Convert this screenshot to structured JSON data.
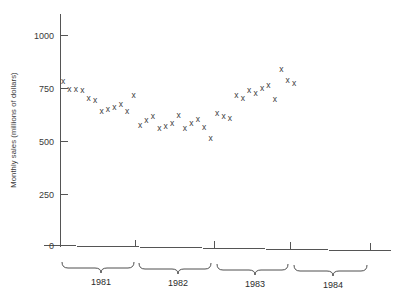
{
  "chart_data": {
    "type": "scatter",
    "title": "",
    "xlabel": "",
    "ylabel": "Monthly sales (millions of dollars)",
    "ylim": [
      0,
      1100
    ],
    "yticks": [
      0,
      250,
      500,
      750,
      1000
    ],
    "ytick_labels": [
      "0",
      "250",
      "500",
      "750",
      "1000"
    ],
    "grid": false,
    "legend": "none",
    "marker": "x",
    "x_axis_style": "year brackets below axis",
    "categories": [
      "1981",
      "1982",
      "1983",
      "1984"
    ],
    "series": [
      {
        "name": "Monthly sales",
        "points": [
          {
            "x": "1981-01",
            "y": 778
          },
          {
            "x": "1981-02",
            "y": 740
          },
          {
            "x": "1981-03",
            "y": 742
          },
          {
            "x": "1981-04",
            "y": 738
          },
          {
            "x": "1981-05",
            "y": 700
          },
          {
            "x": "1981-06",
            "y": 690
          },
          {
            "x": "1981-07",
            "y": 636
          },
          {
            "x": "1981-08",
            "y": 645
          },
          {
            "x": "1981-09",
            "y": 655
          },
          {
            "x": "1981-10",
            "y": 668
          },
          {
            "x": "1981-11",
            "y": 638
          },
          {
            "x": "1981-12",
            "y": 712
          },
          {
            "x": "1982-01",
            "y": 570
          },
          {
            "x": "1982-02",
            "y": 595
          },
          {
            "x": "1982-03",
            "y": 615
          },
          {
            "x": "1982-04",
            "y": 558
          },
          {
            "x": "1982-05",
            "y": 565
          },
          {
            "x": "1982-06",
            "y": 580
          },
          {
            "x": "1982-07",
            "y": 620
          },
          {
            "x": "1982-08",
            "y": 558
          },
          {
            "x": "1982-09",
            "y": 580
          },
          {
            "x": "1982-10",
            "y": 600
          },
          {
            "x": "1982-11",
            "y": 562
          },
          {
            "x": "1982-12",
            "y": 510
          },
          {
            "x": "1983-01",
            "y": 628
          },
          {
            "x": "1983-02",
            "y": 612
          },
          {
            "x": "1983-03",
            "y": 605
          },
          {
            "x": "1983-04",
            "y": 712
          },
          {
            "x": "1983-05",
            "y": 700
          },
          {
            "x": "1983-06",
            "y": 735
          },
          {
            "x": "1983-07",
            "y": 722
          },
          {
            "x": "1983-08",
            "y": 745
          },
          {
            "x": "1983-09",
            "y": 760
          },
          {
            "x": "1983-10",
            "y": 695
          },
          {
            "x": "1983-11",
            "y": 838
          },
          {
            "x": "1983-12",
            "y": 785
          },
          {
            "x": "1984-01",
            "y": 768
          }
        ]
      }
    ],
    "year_brackets": [
      {
        "label": "1981",
        "start_year": 1981
      },
      {
        "label": "1982",
        "start_year": 1982
      },
      {
        "label": "1983",
        "start_year": 1983
      },
      {
        "label": "1984",
        "start_year": 1984
      }
    ]
  },
  "axes": {
    "y_title": "Monthly sales (millions of dollars)",
    "y_tick_labels": [
      "1000",
      "750",
      "500",
      "250",
      "0"
    ]
  },
  "years": {
    "y1": "1981",
    "y2": "1982",
    "y3": "1983",
    "y4": "1984"
  }
}
